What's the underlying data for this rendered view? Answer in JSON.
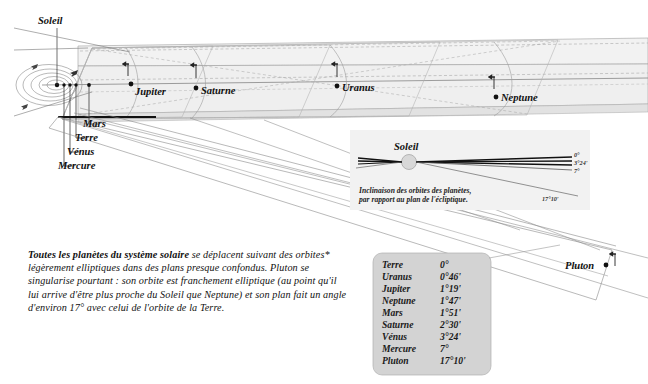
{
  "figure": {
    "title_label": "Soleil",
    "sun_label_inset": "Soleil",
    "caption_inset_line1": "Inclinaison des orbites des planètes,",
    "caption_inset_line2": "par rapport au plan de l'écliptique.",
    "inset_angles": [
      "0°",
      "3°24'",
      "7°",
      "17°10'"
    ],
    "outer_planets": [
      {
        "name": "Jupiter",
        "x": 131,
        "y": 84
      },
      {
        "name": "Saturne",
        "x": 196,
        "y": 88
      },
      {
        "name": "Uranus",
        "x": 337,
        "y": 86
      },
      {
        "name": "Neptune",
        "x": 496,
        "y": 97
      }
    ],
    "inner_planets": [
      "Mars",
      "Terre",
      "Vénus",
      "Mercure"
    ],
    "pluto_label": "Pluton",
    "colors": {
      "band_fill": "#f1f1f1",
      "band_stroke": "#9a9a9a",
      "legend_fill": "#d2d2d2",
      "legend_stroke": "#a8a8a8",
      "inset_fill": "#f2f2f2",
      "line_dark": "#1a1a1a",
      "line_mid": "#888888",
      "line_light": "#b8b8b8",
      "sun_fill": "#d8d8d8"
    }
  },
  "body_text": {
    "lead": "Toutes les planètes du système solaire",
    "rest": " se déplacent suivant des orbites* légèrement elliptiques dans des plans presque confondus. Pluton se singularise pourtant : son orbite est franchement elliptique (au point qu'il lui arrive d'être plus proche du Soleil que Neptune) et son plan fait un angle d'environ 17° avec celui de l'orbite de la Terre."
  },
  "legend": {
    "rows": [
      {
        "planet": "Terre",
        "angle": "0°"
      },
      {
        "planet": "Uranus",
        "angle": "0°46'"
      },
      {
        "planet": "Jupiter",
        "angle": "1°19'"
      },
      {
        "planet": "Neptune",
        "angle": "1°47'"
      },
      {
        "planet": "Mars",
        "angle": "1°51'"
      },
      {
        "planet": "Saturne",
        "angle": "2°30'"
      },
      {
        "planet": "Vénus",
        "angle": "3°24'"
      },
      {
        "planet": "Mercure",
        "angle": "7°"
      },
      {
        "planet": "Pluton",
        "angle": "17°10'"
      }
    ]
  }
}
